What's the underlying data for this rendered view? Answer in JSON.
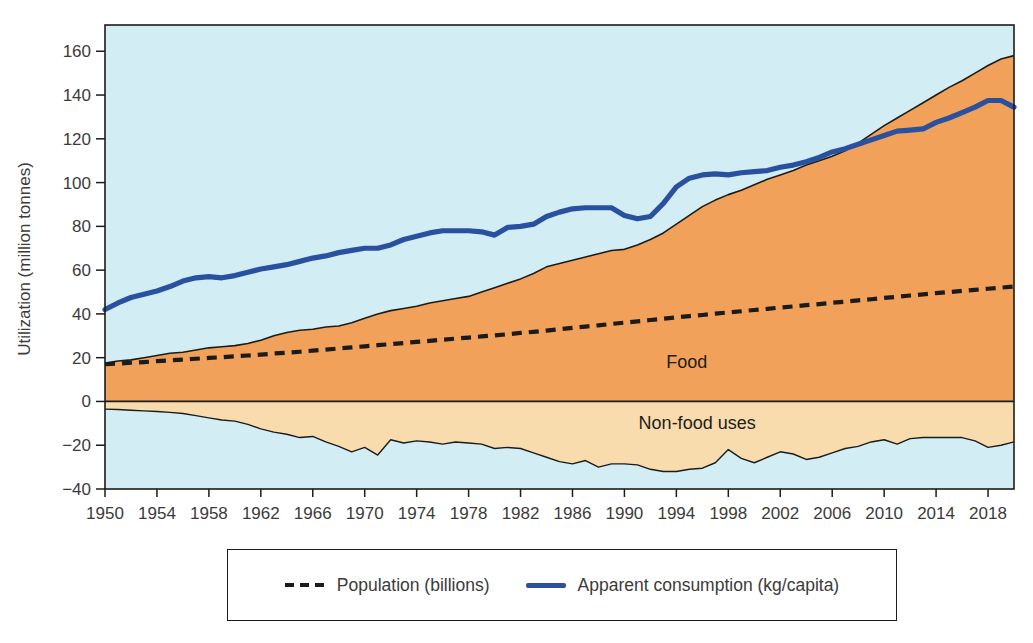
{
  "figure": {
    "background": "#ffffff"
  },
  "legend": {
    "items": [
      {
        "key": "population",
        "label": "Population (billions)",
        "swatch": "dashed-line",
        "color": "#1b1b19"
      },
      {
        "key": "consumption",
        "label": "Apparent consumption (kg/capita)",
        "swatch": "solid-line",
        "color": "#2a519f"
      }
    ]
  },
  "chart_data": {
    "type": "area",
    "title": "",
    "xlabel": "",
    "ylabel": "Utilization (million tonnes)",
    "xlim": [
      1950,
      2020
    ],
    "ylim": [
      -40,
      172
    ],
    "grid": false,
    "legend_position": "bottom",
    "colors": {
      "plot_background": "#d2edf3",
      "food_area": "#f1a159",
      "nonfood_area": "#f8dcae",
      "boundary_line": "#1c1c1b",
      "zero_line": "#1c1c1b",
      "population_line": "#1b1b19",
      "consumption_line": "#2a519f",
      "tick_text": "#3b3b3a",
      "frame": "#1c1c1b"
    },
    "x_ticks": [
      1950,
      1954,
      1958,
      1962,
      1966,
      1970,
      1974,
      1978,
      1982,
      1986,
      1990,
      1994,
      1998,
      2002,
      2006,
      2010,
      2014,
      2018
    ],
    "y_ticks": [
      {
        "value": 160,
        "label": "160"
      },
      {
        "value": 140,
        "label": "140"
      },
      {
        "value": 120,
        "label": "120"
      },
      {
        "value": 100,
        "label": "100"
      },
      {
        "value": 80,
        "label": "80"
      },
      {
        "value": 60,
        "label": "60"
      },
      {
        "value": 40,
        "label": "40"
      },
      {
        "value": 20,
        "label": "20"
      },
      {
        "value": 0,
        "label": "0"
      },
      {
        "value": -20,
        "label": "−20"
      },
      {
        "value": -40,
        "label": "−40"
      }
    ],
    "years": [
      1950,
      1951,
      1952,
      1953,
      1954,
      1955,
      1956,
      1957,
      1958,
      1959,
      1960,
      1961,
      1962,
      1963,
      1964,
      1965,
      1966,
      1967,
      1968,
      1969,
      1970,
      1971,
      1972,
      1973,
      1974,
      1975,
      1976,
      1977,
      1978,
      1979,
      1980,
      1981,
      1982,
      1983,
      1984,
      1985,
      1986,
      1987,
      1988,
      1989,
      1990,
      1991,
      1992,
      1993,
      1994,
      1995,
      1996,
      1997,
      1998,
      1999,
      2000,
      2001,
      2002,
      2003,
      2004,
      2005,
      2006,
      2007,
      2008,
      2009,
      2010,
      2011,
      2012,
      2013,
      2014,
      2015,
      2016,
      2017,
      2018,
      2019,
      2020
    ],
    "series": [
      {
        "key": "food",
        "name": "Food",
        "type": "area",
        "color": "#f1a159",
        "values": [
          17.5,
          18.5,
          19,
          20,
          21,
          22,
          22.5,
          23.5,
          24.5,
          25,
          25.5,
          26.5,
          28,
          30,
          31.5,
          32.5,
          33,
          34,
          34.5,
          36,
          38,
          40,
          41.5,
          42.5,
          43.5,
          45,
          46,
          47,
          48,
          50,
          52,
          54,
          56,
          58.5,
          61.5,
          63,
          64.5,
          66,
          67.5,
          69,
          69.5,
          71.5,
          74,
          77,
          81,
          85,
          89,
          92,
          94.5,
          96.5,
          99,
          101.5,
          103.5,
          105.5,
          108,
          110,
          112,
          114.5,
          118,
          122,
          126,
          129.5,
          133,
          136.5,
          140,
          143.5,
          146.5,
          150,
          153.5,
          156.5,
          158
        ]
      },
      {
        "key": "nonfood",
        "name": "Non-food uses",
        "type": "area",
        "color": "#f8dcae",
        "values": [
          -3.5,
          -3.7,
          -4,
          -4.3,
          -4.6,
          -5,
          -5.5,
          -6.5,
          -7.5,
          -8.5,
          -9,
          -10.5,
          -12.5,
          -14,
          -15,
          -16.5,
          -16,
          -18.5,
          -20.5,
          -23,
          -21,
          -24.5,
          -17.5,
          -19,
          -18,
          -18.5,
          -19.5,
          -18.5,
          -19,
          -19.5,
          -21.5,
          -21,
          -21.5,
          -23.5,
          -25.5,
          -27.5,
          -28.5,
          -27,
          -30,
          -28.5,
          -28.5,
          -29,
          -31,
          -32,
          -32,
          -31,
          -30.5,
          -28,
          -22,
          -26,
          -28,
          -25.5,
          -23,
          -24,
          -26.5,
          -25.5,
          -23.5,
          -21.5,
          -20.5,
          -18.5,
          -17.5,
          -19.5,
          -17,
          -16.5,
          -16.5,
          -16.5,
          -16.5,
          -18,
          -21,
          -20,
          -18.5
        ]
      },
      {
        "key": "population",
        "name": "Population (billions)",
        "type": "line",
        "line_style": "dashed",
        "color": "#1b1b19",
        "values": [
          17,
          17.3,
          17.7,
          18,
          18.4,
          18.8,
          19.1,
          19.5,
          19.9,
          20.2,
          20.6,
          21,
          21.4,
          21.9,
          22.3,
          22.7,
          23.2,
          23.7,
          24.2,
          24.7,
          25.2,
          25.7,
          26.2,
          26.7,
          27.2,
          27.7,
          28.2,
          28.7,
          29.2,
          29.7,
          30.2,
          30.7,
          31.3,
          31.8,
          32.4,
          33,
          33.6,
          34.2,
          34.8,
          35.4,
          36,
          36.6,
          37.2,
          37.8,
          38.4,
          39,
          39.5,
          40.1,
          40.7,
          41.2,
          41.8,
          42.3,
          42.9,
          43.4,
          44,
          44.5,
          45.1,
          45.6,
          46.2,
          46.7,
          47.3,
          47.8,
          48.4,
          48.9,
          49.5,
          50,
          50.5,
          51,
          51.5,
          52,
          52.5
        ]
      },
      {
        "key": "consumption",
        "name": "Apparent consumption (kg/capita)",
        "type": "line",
        "line_style": "solid",
        "color": "#2a519f",
        "values": [
          42,
          45,
          47.5,
          49,
          50.5,
          52.5,
          55,
          56.5,
          57,
          56.5,
          57.5,
          59,
          60.5,
          61.5,
          62.5,
          64,
          65.5,
          66.5,
          68,
          69,
          70,
          70,
          71.5,
          74,
          75.5,
          77,
          78,
          78,
          78,
          77.5,
          76,
          79.5,
          80,
          81,
          84.5,
          86.5,
          88,
          88.5,
          88.5,
          88.5,
          85,
          83.5,
          84.5,
          90.5,
          98,
          102,
          103.5,
          104,
          103.5,
          104.5,
          105,
          105.5,
          107,
          108,
          109.5,
          111.5,
          114,
          115.5,
          117.5,
          119.5,
          121.5,
          123.5,
          124,
          124.5,
          127.5,
          129.5,
          132,
          134.5,
          137.5,
          137.5,
          134.5
        ]
      }
    ],
    "annotations": [
      {
        "text": "Food",
        "year": 1994.8,
        "value": 15.5
      },
      {
        "text": "Non-food uses",
        "year": 1995.6,
        "value": -12.5
      }
    ]
  }
}
